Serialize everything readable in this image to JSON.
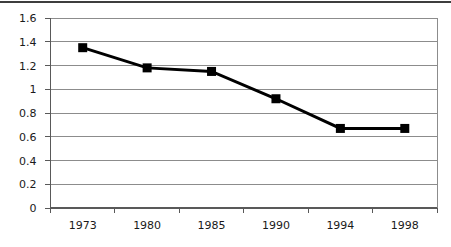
{
  "chart_data": {
    "type": "line",
    "title": "",
    "xlabel": "",
    "ylabel": "",
    "categories": [
      "1973",
      "1980",
      "1985",
      "1990",
      "1994",
      "1998"
    ],
    "series": [
      {
        "name": "series1",
        "values": [
          1.35,
          1.18,
          1.15,
          0.92,
          0.67,
          0.67
        ]
      }
    ],
    "ylim": [
      0,
      1.6
    ],
    "ytick_step": 0.2,
    "ytick_labels": [
      "0",
      "0.2",
      "0.4",
      "0.6",
      "0.8",
      "1",
      "1.2",
      "1.4",
      "1.6"
    ],
    "grid": "horizontal-only",
    "legend": "none",
    "marker_shape": "filled-square",
    "colors": {
      "line": "#000000",
      "marker": "#000000",
      "gridline": "#8c8c8c",
      "plot_border": "#8c8c8c",
      "axis": "#595959",
      "tick_label": "#1a1a1a",
      "background": "#ffffff",
      "top_rule": "#3d3d3d"
    }
  }
}
